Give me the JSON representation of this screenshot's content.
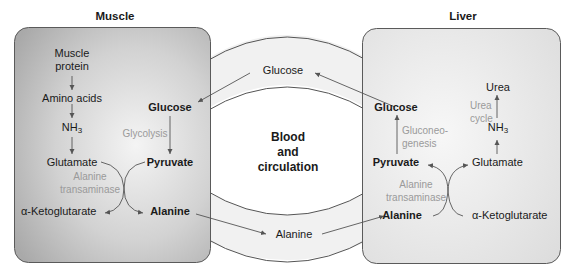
{
  "diagram": {
    "type": "glucose-alanine cycle",
    "colors": {
      "panel_border": "#5a5a5a",
      "muscle_fill": "#b9b9b9",
      "liver_fill": "#e6e6e6",
      "circulation_band": "#f2f2f2",
      "arrow": "#555555",
      "enzyme_text": "#9a9a9a"
    }
  },
  "muscle": {
    "title": "Muscle",
    "muscle_protein_line1": "Muscle",
    "muscle_protein_line2": "protein",
    "amino_acids": "Amino acids",
    "nh3": "NH",
    "nh3_sub": "3",
    "glutamate": "Glutamate",
    "alpha_ketoglutarate": "α-Ketoglutarate",
    "enzyme_line1": "Alanine",
    "enzyme_line2": "transaminase",
    "glucose": "Glucose",
    "glycolysis": "Glycolysis",
    "pyruvate": "Pyruvate",
    "alanine": "Alanine"
  },
  "circulation": {
    "line1": "Blood",
    "line2": "and",
    "line3": "circulation",
    "glucose": "Glucose",
    "alanine": "Alanine"
  },
  "liver": {
    "title": "Liver",
    "glucose": "Glucose",
    "gluconeogenesis_line1": "Gluconeo-",
    "gluconeogenesis_line2": "genesis",
    "pyruvate": "Pyruvate",
    "enzyme_line1": "Alanine",
    "enzyme_line2": "transaminase",
    "alanine": "Alanine",
    "urea": "Urea",
    "urea_cycle_line1": "Urea",
    "urea_cycle_line2": "cycle",
    "nh3": "NH",
    "nh3_sub": "3",
    "glutamate": "Glutamate",
    "alpha_ketoglutarate": "α-Ketoglutarate"
  }
}
